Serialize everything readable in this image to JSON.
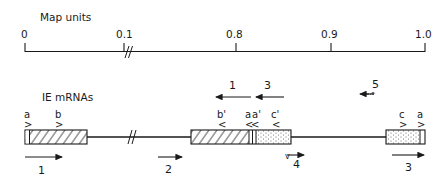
{
  "map_scale": {
    "title": "Map units",
    "ticks": [
      {
        "label": "0",
        "x": 25
      },
      {
        "label": "0.1",
        "x": 124
      },
      {
        "label": "0.8",
        "x": 236
      },
      {
        "label": "0.9",
        "x": 331
      },
      {
        "label": "1.0",
        "x": 425
      }
    ],
    "break_symbol": "//"
  },
  "mrna_map": {
    "title": "IE mRNAs",
    "break_symbol": "//",
    "site_labels": [
      {
        "label": "a",
        "arrow": ">",
        "x": 27
      },
      {
        "label": "b",
        "arrow": ">",
        "x": 58
      },
      {
        "label": "b'",
        "arrow": "<",
        "x": 220
      },
      {
        "label": "a",
        "arrow": "<",
        "x": 248
      },
      {
        "label": "a'",
        "arrow": "<",
        "x": 255
      },
      {
        "label": "c'",
        "arrow": "<",
        "x": 274
      },
      {
        "label": "c",
        "arrow": ">",
        "x": 402
      },
      {
        "label": "a",
        "arrow": ">",
        "x": 420
      }
    ],
    "transcripts": [
      {
        "label": "1",
        "direction": "right",
        "position": "below-left"
      },
      {
        "label": "2",
        "direction": "right",
        "position": "below-middle"
      },
      {
        "label": "1",
        "direction": "left",
        "position": "above-center"
      },
      {
        "label": "3",
        "direction": "left",
        "position": "above-center"
      },
      {
        "label": "4",
        "direction": "right",
        "position": "below-center"
      },
      {
        "label": "5",
        "direction": "left",
        "position": "above-right"
      },
      {
        "label": "3",
        "direction": "right",
        "position": "below-right"
      }
    ]
  }
}
